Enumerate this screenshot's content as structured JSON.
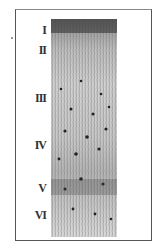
{
  "figure": {
    "layers": [
      {
        "label": "I",
        "y": 24
      },
      {
        "label": "II",
        "y": 44
      },
      {
        "label": "III",
        "y": 92
      },
      {
        "label": "IV",
        "y": 139
      },
      {
        "label": "V",
        "y": 182
      },
      {
        "label": "VI",
        "y": 209
      }
    ],
    "colors": {
      "ink": "#333333",
      "frame": "#555555",
      "background": "#ffffff"
    }
  }
}
